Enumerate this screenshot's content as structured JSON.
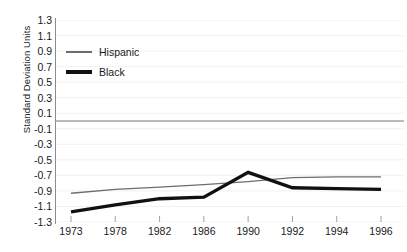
{
  "chart_data": {
    "type": "line",
    "title": "",
    "xlabel": "",
    "ylabel": "Standard Deviation Units",
    "categories": [
      "1973",
      "1978",
      "1982",
      "1986",
      "1990",
      "1992",
      "1994",
      "1996"
    ],
    "x": [
      1973,
      1978,
      1982,
      1986,
      1990,
      1992,
      1994,
      1996
    ],
    "ylim": [
      -1.3,
      1.3
    ],
    "yticks": [
      "1.3",
      "1.1",
      "0.9",
      "0.7",
      "0.5",
      "0.3",
      "0.1",
      "-0.1",
      "-0.3",
      "-0.5",
      "-0.7",
      "-0.9",
      "-1.1",
      "-1.3"
    ],
    "ytick_values": [
      1.3,
      1.1,
      0.9,
      0.7,
      0.5,
      0.3,
      0.1,
      -0.1,
      -0.3,
      -0.5,
      -0.7,
      -0.9,
      -1.1,
      -1.3
    ],
    "grid": true,
    "legend_position": "upper-left",
    "zero_line": 0,
    "series": [
      {
        "name": "Hispanic",
        "style": "thin",
        "color": "#6d6d6d",
        "values": [
          -0.93,
          -0.88,
          -0.85,
          -0.82,
          -0.78,
          -0.73,
          -0.72,
          -0.72
        ]
      },
      {
        "name": "Black",
        "style": "thick",
        "color": "#111111",
        "values": [
          -1.17,
          -1.08,
          -1.0,
          -0.98,
          -0.66,
          -0.86,
          -0.87,
          -0.88
        ]
      }
    ]
  }
}
